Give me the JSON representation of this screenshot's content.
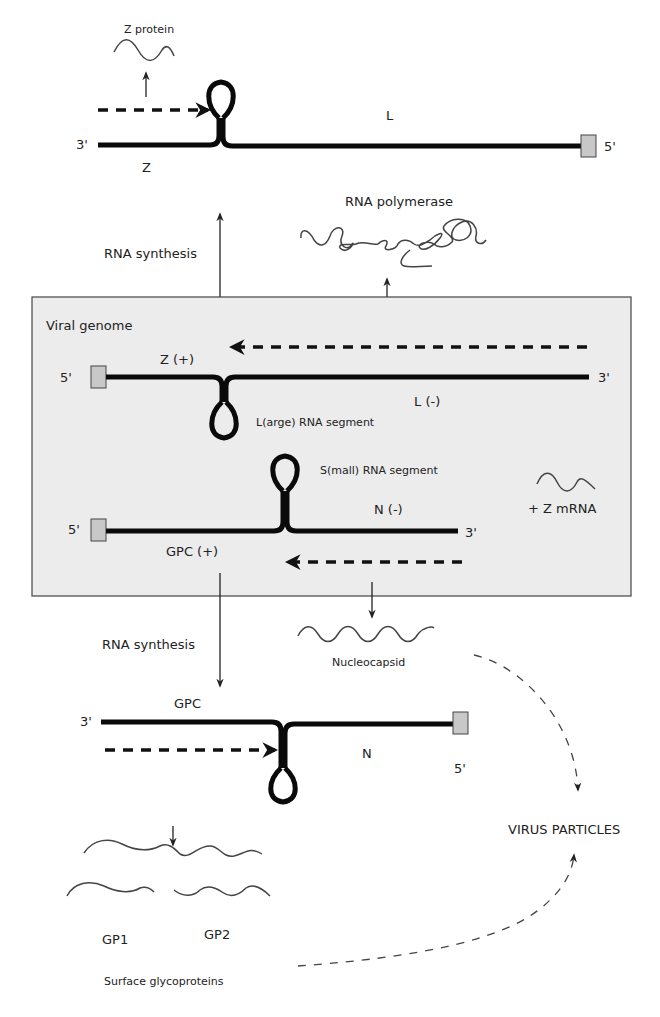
{
  "diagram": {
    "type": "viral replication cycle (arenavirus ambisense genome)",
    "colors": {
      "strand": "#0a0a0a",
      "genome_box_fill": "#ececec",
      "cap_fill": "#c8c8c8",
      "text": "#222222"
    },
    "top_segment": {
      "three_prime": "3'",
      "five_prime": "5'",
      "left_gene": "Z",
      "right_gene": "L",
      "product": "Z protein"
    },
    "upper_middle": {
      "rna_synthesis": "RNA synthesis",
      "polymerase": "RNA polymerase"
    },
    "genome_box": {
      "title": "Viral genome",
      "large_segment": {
        "five_prime": "5'",
        "three_prime": "3'",
        "plus_gene": "Z (+)",
        "minus_gene": "L (-)",
        "name": "L(arge) RNA segment"
      },
      "small_segment": {
        "five_prime": "5'",
        "three_prime": "3'",
        "plus_gene": "GPC (+)",
        "minus_gene": "N (-)",
        "name": "S(mall) RNA segment"
      },
      "mrna": "+ Z mRNA"
    },
    "lower_middle": {
      "rna_synthesis": "RNA synthesis",
      "nucleocapsid": "Nucleocapsid"
    },
    "bottom_segment": {
      "three_prime": "3'",
      "five_prime": "5'",
      "left_gene": "GPC",
      "right_gene": "N"
    },
    "glycoproteins": {
      "gp1": "GP1",
      "gp2": "GP2",
      "caption": "Surface glycoproteins"
    },
    "virus_particles": "VIRUS PARTICLES"
  }
}
